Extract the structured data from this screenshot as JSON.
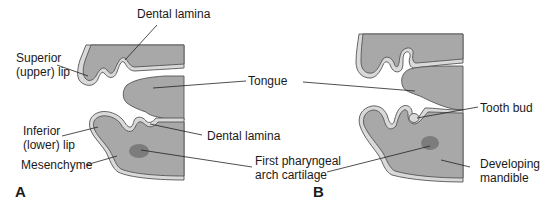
{
  "figure": {
    "panels": [
      {
        "id": "A",
        "label": "A",
        "labels": {
          "dental_lamina_top": "Dental lamina",
          "superior_lip_line1": "Superior",
          "superior_lip_line2": "(upper) lip",
          "inferior_lip_line1": "Inferior",
          "inferior_lip_line2": "(lower) lip",
          "mesenchyme": "Mesenchyme",
          "dental_lamina_bottom": "Dental lamina"
        }
      },
      {
        "id": "B",
        "label": "B",
        "labels": {
          "tooth_bud": "Tooth bud",
          "developing_mandible_line1": "Developing",
          "developing_mandible_line2": "mandible"
        }
      }
    ],
    "shared_labels": {
      "tongue": "Tongue",
      "first_pharyngeal_line1": "First pharyngeal",
      "first_pharyngeal_line2": "arch cartilage"
    },
    "colors": {
      "mesenchyme_fill": "#a8a8a8",
      "epithelium_fill": "#d9d9d9",
      "cartilage_fill": "#7c7c7c",
      "outline": "#555555",
      "text": "#1a1a1a",
      "background": "#ffffff"
    }
  }
}
